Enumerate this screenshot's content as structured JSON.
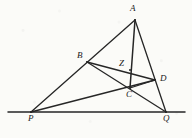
{
  "figure": {
    "kind": "geometry-diagram",
    "background_color": "#fbfbf8",
    "stroke_color": "#262626",
    "label_color": "#1a1a1a",
    "width": 192,
    "height": 138,
    "points": [
      {
        "id": "A",
        "label": "A",
        "x": 135,
        "y": 20,
        "label_x": 130,
        "label_y": 4
      },
      {
        "id": "B",
        "label": "B",
        "x": 87,
        "y": 62,
        "label_x": 77,
        "label_y": 51
      },
      {
        "id": "Z",
        "label": "Z",
        "x": 130,
        "y": 70,
        "label_x": 119,
        "label_y": 59
      },
      {
        "id": "D",
        "label": "D",
        "x": 155,
        "y": 80,
        "label_x": 160,
        "label_y": 74
      },
      {
        "id": "C",
        "label": "C",
        "x": 130,
        "y": 88,
        "label_x": 126,
        "label_y": 90
      },
      {
        "id": "P",
        "label": "P",
        "x": 31,
        "y": 112,
        "label_x": 28,
        "label_y": 114
      },
      {
        "id": "Q",
        "label": "Q",
        "x": 166,
        "y": 112,
        "label_x": 163,
        "label_y": 114
      }
    ],
    "segments": [
      {
        "name": "line-PQ-baseline",
        "from": [
          8,
          112
        ],
        "to": [
          185,
          112
        ],
        "width": 1.5
      },
      {
        "name": "segment-A-P",
        "from": [
          135,
          20
        ],
        "to": [
          31,
          112
        ],
        "width": 1.3
      },
      {
        "name": "segment-A-Q",
        "from": [
          135,
          20
        ],
        "to": [
          166,
          112
        ],
        "width": 1.3
      },
      {
        "name": "segment-A-C",
        "from": [
          135,
          20
        ],
        "to": [
          130,
          88
        ],
        "width": 1.5
      },
      {
        "name": "segment-B-D",
        "from": [
          87,
          62
        ],
        "to": [
          155,
          80
        ],
        "width": 1.3
      },
      {
        "name": "segment-B-Q",
        "from": [
          87,
          62
        ],
        "to": [
          166,
          112
        ],
        "width": 1.3
      },
      {
        "name": "segment-P-D",
        "from": [
          31,
          112
        ],
        "to": [
          155,
          80
        ],
        "width": 1.3
      },
      {
        "name": "segment-C-D",
        "from": [
          130,
          88
        ],
        "to": [
          155,
          80
        ],
        "width": 1.3
      }
    ]
  }
}
